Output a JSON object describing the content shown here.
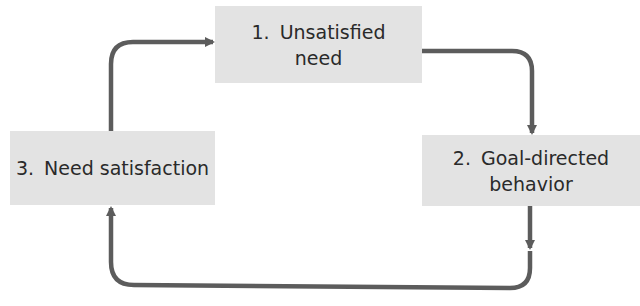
{
  "diagram": {
    "colors": {
      "box_fill": "#e3e3e3",
      "arrow": "#5c5c5c",
      "text": "#2a2a2a"
    },
    "nodes": [
      {
        "id": "1",
        "number": "1.",
        "line1": "Unsatisfied",
        "line2": "need"
      },
      {
        "id": "2",
        "number": "2.",
        "line1": "Goal-directed",
        "line2": "behavior"
      },
      {
        "id": "3",
        "number": "3.",
        "label": "Need satisfaction"
      }
    ],
    "edges": [
      {
        "from": "1",
        "to": "2"
      },
      {
        "from": "2",
        "to": "3"
      },
      {
        "from": "3",
        "to": "1"
      }
    ]
  }
}
